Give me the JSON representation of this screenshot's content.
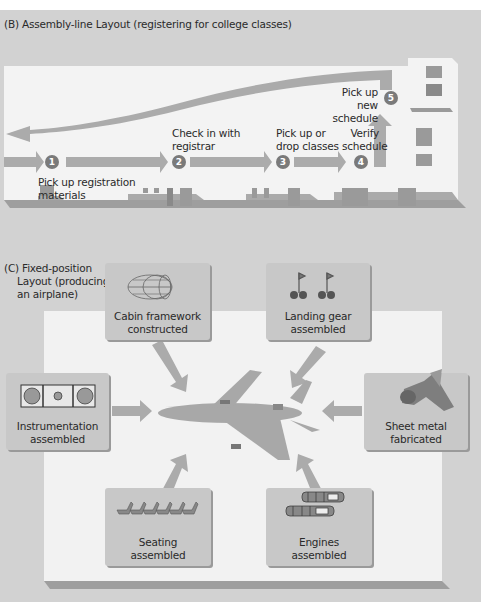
{
  "section_b": {
    "title": "(B) Assembly-line Layout (registering for college classes)",
    "steps": [
      {
        "number": "1",
        "label_line1": "Pick up registration",
        "label_line2": "materials"
      },
      {
        "number": "2",
        "label_line1": "Check in with",
        "label_line2": "registrar"
      },
      {
        "number": "3",
        "label_line1": "Pick up or",
        "label_line2": "drop classes"
      },
      {
        "number": "4",
        "label_line1": "Verify",
        "label_line2": "schedule"
      },
      {
        "number": "5",
        "label_line1": "Pick up new",
        "label_line2": "schedule"
      }
    ]
  },
  "section_c": {
    "title_line1": "(C) Fixed-position",
    "title_line2": "Layout (producing",
    "title_line3": "an airplane)",
    "center": "airplane",
    "stations": [
      {
        "id": "cabin",
        "line1": "Cabin framework",
        "line2": "constructed",
        "icon": "cabin-frame-icon"
      },
      {
        "id": "landing",
        "line1": "Landing gear",
        "line2": "assembled",
        "icon": "landing-gear-icon"
      },
      {
        "id": "instrumentation",
        "line1": "Instrumentation",
        "line2": "assembled",
        "icon": "instrument-panel-icon"
      },
      {
        "id": "sheet",
        "line1": "Sheet metal",
        "line2": "fabricated",
        "icon": "sheet-metal-icon"
      },
      {
        "id": "seating",
        "line1": "Seating",
        "line2": "assembled",
        "icon": "seats-icon"
      },
      {
        "id": "engines",
        "line1": "Engines",
        "line2": "assembled",
        "icon": "engines-icon"
      }
    ]
  },
  "colors": {
    "panel": "#d2d2d2",
    "floor": "#f2f2f2",
    "arrow": "#a9a9a9",
    "badge": "#7a7a7a",
    "box": "#c8c8c8"
  }
}
